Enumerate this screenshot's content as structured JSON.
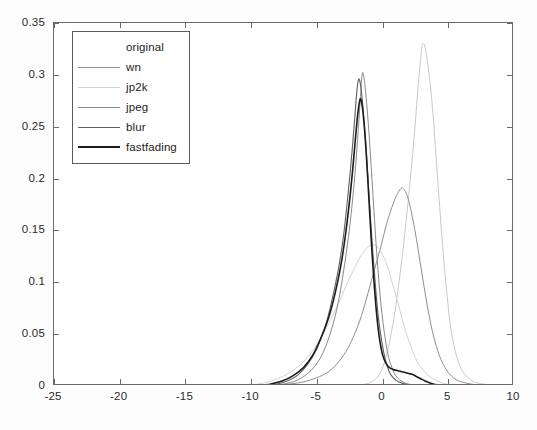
{
  "chart_data": {
    "type": "line",
    "title": "",
    "xlabel": "",
    "ylabel": "",
    "xlim": [
      -25,
      10
    ],
    "ylim": [
      0,
      0.35
    ],
    "grid": false,
    "legend_position": "upper-left",
    "x_ticks": [
      "-25",
      "-20",
      "-15",
      "-10",
      "-5",
      "0",
      "5",
      "10"
    ],
    "x_tick_values": [
      -25,
      -20,
      -15,
      -10,
      -5,
      0,
      5,
      10
    ],
    "y_ticks": [
      "0",
      "0.05",
      "0.1",
      "0.15",
      "0.2",
      "0.25",
      "0.3",
      "0.35"
    ],
    "y_tick_values": [
      0,
      0.05,
      0.1,
      0.15,
      0.2,
      0.25,
      0.3,
      0.35
    ],
    "series": [
      {
        "name": "original",
        "color": "#c9c9c9",
        "width": 1.0,
        "peak_x": 3.0,
        "peak_y": 0.33,
        "x": [
          -3.0,
          -2.0,
          -1.0,
          -0.2,
          0.4,
          0.9,
          1.3,
          1.7,
          2.0,
          2.3,
          2.5,
          2.7,
          2.9,
          3.0,
          3.15,
          3.3,
          3.5,
          3.7,
          3.9,
          4.1,
          4.35,
          4.6,
          4.9,
          5.2,
          5.6,
          6.1,
          6.8,
          7.6,
          8.5,
          10.0
        ],
        "values": [
          0.0,
          0.001,
          0.003,
          0.012,
          0.035,
          0.068,
          0.105,
          0.148,
          0.185,
          0.225,
          0.255,
          0.288,
          0.315,
          0.328,
          0.33,
          0.322,
          0.305,
          0.282,
          0.252,
          0.215,
          0.172,
          0.13,
          0.088,
          0.055,
          0.03,
          0.014,
          0.005,
          0.002,
          0.001,
          0.0
        ]
      },
      {
        "name": "wn",
        "color": "#8e8e8e",
        "width": 1.0,
        "peak_x": 1.5,
        "peak_y": 0.191,
        "x": [
          -9.0,
          -8.0,
          -7.0,
          -6.0,
          -5.0,
          -4.2,
          -3.5,
          -2.8,
          -2.2,
          -1.6,
          -1.1,
          -0.6,
          -0.1,
          0.3,
          0.7,
          1.0,
          1.25,
          1.45,
          1.6,
          1.8,
          2.0,
          2.2,
          2.45,
          2.7,
          3.0,
          3.3,
          3.7,
          4.1,
          4.5,
          5.0,
          5.6,
          6.3,
          7.2,
          8.3,
          10.0
        ],
        "values": [
          0.0,
          0.001,
          0.002,
          0.004,
          0.008,
          0.013,
          0.021,
          0.033,
          0.048,
          0.068,
          0.09,
          0.113,
          0.136,
          0.156,
          0.172,
          0.182,
          0.188,
          0.191,
          0.19,
          0.186,
          0.178,
          0.167,
          0.151,
          0.132,
          0.108,
          0.085,
          0.058,
          0.038,
          0.024,
          0.013,
          0.006,
          0.003,
          0.001,
          0.0,
          0.0
        ]
      },
      {
        "name": "jp2k",
        "color": "#d2d2d2",
        "width": 1.0,
        "peak_x": -0.8,
        "peak_y": 0.136,
        "x": [
          -11.0,
          -10.0,
          -9.0,
          -8.0,
          -7.2,
          -6.4,
          -5.7,
          -5.0,
          -4.4,
          -3.8,
          -3.2,
          -2.7,
          -2.2,
          -1.8,
          -1.4,
          -1.1,
          -0.8,
          -0.5,
          -0.2,
          0.1,
          0.4,
          0.7,
          1.0,
          1.4,
          1.8,
          2.3,
          2.8,
          3.4,
          4.0,
          4.8,
          5.8,
          7.0,
          8.5,
          10.0
        ],
        "values": [
          0.0,
          0.001,
          0.003,
          0.007,
          0.012,
          0.019,
          0.028,
          0.04,
          0.053,
          0.068,
          0.084,
          0.099,
          0.112,
          0.122,
          0.13,
          0.134,
          0.136,
          0.135,
          0.131,
          0.124,
          0.114,
          0.101,
          0.088,
          0.069,
          0.051,
          0.033,
          0.02,
          0.011,
          0.006,
          0.002,
          0.001,
          0.0,
          0.0,
          0.0
        ]
      },
      {
        "name": "jpeg",
        "color": "#8a8a8a",
        "width": 1.0,
        "peak_x": -1.55,
        "peak_y": 0.301,
        "x": [
          -8.5,
          -7.5,
          -6.6,
          -5.8,
          -5.1,
          -4.5,
          -4.0,
          -3.5,
          -3.1,
          -2.7,
          -2.4,
          -2.1,
          -1.9,
          -1.7,
          -1.55,
          -1.4,
          -1.25,
          -1.1,
          -0.95,
          -0.8,
          -0.65,
          -0.5,
          -0.3,
          -0.1,
          0.15,
          0.4,
          0.7,
          1.0,
          1.4,
          1.9,
          2.5,
          3.2,
          4.2,
          5.5,
          7.0,
          10.0
        ],
        "values": [
          0.0,
          0.002,
          0.005,
          0.011,
          0.02,
          0.033,
          0.05,
          0.073,
          0.1,
          0.134,
          0.165,
          0.205,
          0.238,
          0.275,
          0.301,
          0.296,
          0.278,
          0.255,
          0.228,
          0.198,
          0.168,
          0.138,
          0.104,
          0.076,
          0.05,
          0.031,
          0.018,
          0.01,
          0.005,
          0.002,
          0.001,
          0.0,
          0.0,
          0.0,
          0.0,
          0.0
        ]
      },
      {
        "name": "blur",
        "color": "#5f5f5f",
        "width": 1.1,
        "peak_x": -1.9,
        "peak_y": 0.296,
        "x": [
          -9.0,
          -8.0,
          -7.2,
          -6.4,
          -5.7,
          -5.0,
          -4.4,
          -3.9,
          -3.4,
          -3.0,
          -2.7,
          -2.4,
          -2.15,
          -1.95,
          -1.8,
          -1.65,
          -1.5,
          -1.35,
          -1.2,
          -1.05,
          -0.9,
          -0.7,
          -0.5,
          -0.3,
          -0.05,
          0.2,
          0.5,
          0.8,
          1.2,
          1.7,
          2.3,
          3.0,
          4.0,
          5.5,
          7.5,
          10.0
        ],
        "values": [
          0.0,
          0.002,
          0.005,
          0.011,
          0.021,
          0.036,
          0.056,
          0.08,
          0.11,
          0.142,
          0.176,
          0.215,
          0.253,
          0.285,
          0.296,
          0.288,
          0.27,
          0.246,
          0.218,
          0.188,
          0.158,
          0.122,
          0.09,
          0.064,
          0.042,
          0.026,
          0.014,
          0.008,
          0.004,
          0.002,
          0.001,
          0.0,
          0.0,
          0.0,
          0.0,
          0.0
        ]
      },
      {
        "name": "fastfading",
        "color": "#1c1c1c",
        "width": 1.6,
        "peak_x": -1.7,
        "peak_y": 0.277,
        "x": [
          -9.5,
          -8.5,
          -7.6,
          -6.8,
          -6.0,
          -5.3,
          -4.7,
          -4.1,
          -3.6,
          -3.15,
          -2.8,
          -2.5,
          -2.25,
          -2.0,
          -1.85,
          -1.7,
          -1.55,
          -1.4,
          -1.25,
          -1.1,
          -0.95,
          -0.8,
          -0.65,
          -0.5,
          -0.35,
          -0.2,
          0.0,
          0.25,
          0.5,
          0.8,
          1.1,
          1.4,
          1.7,
          2.0,
          2.3,
          2.6,
          2.9,
          3.2,
          3.6,
          4.2,
          5.0,
          6.0,
          7.5,
          10.0
        ],
        "values": [
          0.0,
          0.002,
          0.005,
          0.01,
          0.018,
          0.03,
          0.046,
          0.066,
          0.09,
          0.118,
          0.148,
          0.18,
          0.212,
          0.248,
          0.266,
          0.277,
          0.27,
          0.252,
          0.226,
          0.194,
          0.16,
          0.128,
          0.1,
          0.076,
          0.057,
          0.043,
          0.03,
          0.022,
          0.018,
          0.016,
          0.015,
          0.014,
          0.013,
          0.012,
          0.011,
          0.009,
          0.007,
          0.005,
          0.003,
          0.001,
          0.0005,
          0.0,
          0.0,
          0.0
        ]
      }
    ]
  },
  "legend": {
    "entries": [
      {
        "label": "original",
        "color": "#ffffff",
        "width": 0
      },
      {
        "label": "wn",
        "color": "#8e8e8e",
        "width": 1
      },
      {
        "label": "jp2k",
        "color": "#d2d2d2",
        "width": 1
      },
      {
        "label": "jpeg",
        "color": "#8a8a8a",
        "width": 1
      },
      {
        "label": "blur",
        "color": "#5f5f5f",
        "width": 1.3
      },
      {
        "label": "fastfading",
        "color": "#1c1c1c",
        "width": 2
      }
    ]
  },
  "axes": {
    "frame_color": "#6a6a6a",
    "tick_label_color": "#2a2a2a"
  }
}
